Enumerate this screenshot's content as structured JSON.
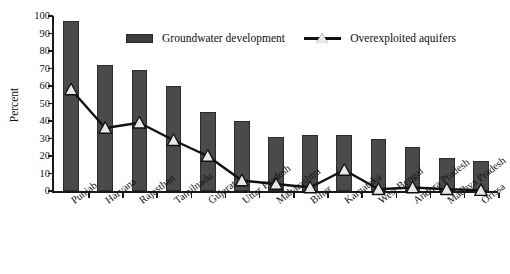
{
  "chart_data": {
    "type": "bar",
    "title": "",
    "xlabel": "",
    "ylabel": "Percent",
    "ylim": [
      0,
      100
    ],
    "ytick_step": 10,
    "yticks": [
      0,
      10,
      20,
      30,
      40,
      50,
      60,
      70,
      80,
      90,
      100
    ],
    "grid": false,
    "legend_position": "top-center",
    "categories": [
      "Punjab",
      "Haryana",
      "Rajasthan",
      "Tamilnadu",
      "Gujarat",
      "Uttar Pradesh",
      "Maharashtra",
      "Bihar",
      "Karnataka",
      "West Bengal",
      "Andhra Pradesh",
      "Madhya Pradesh",
      "Orissa"
    ],
    "series": [
      {
        "name": "Groundwater development",
        "type": "bar",
        "color": "#4a4a4a",
        "values": [
          97,
          72,
          69,
          60,
          45,
          40,
          31,
          32,
          32,
          30,
          25,
          19,
          17
        ]
      },
      {
        "name": "Overexploited aquifers",
        "type": "line",
        "color": "#111111",
        "marker": "triangle-up",
        "marker_fill": "#e8e8e8",
        "values": [
          58,
          36,
          39,
          29,
          20,
          6,
          4,
          2,
          12,
          1,
          2,
          1,
          0.5
        ]
      }
    ]
  },
  "legend": {
    "bar_label": "Groundwater development",
    "line_label": "Overexploited aquifers",
    "bar_icon": "filled-rectangle-icon",
    "line_icon": "line-with-triangle-marker-icon"
  },
  "axes": {
    "y_title": "Percent"
  }
}
